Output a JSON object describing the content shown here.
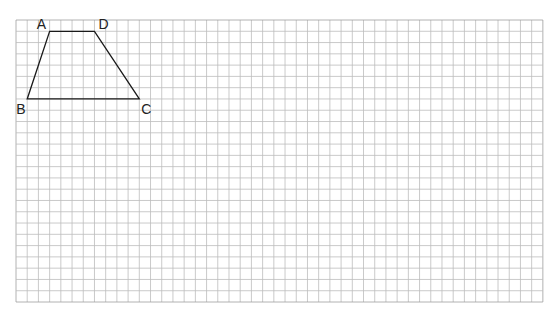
{
  "grid": {
    "left": 16,
    "top": 20,
    "cols": 47,
    "rows": 25,
    "cell_w": 11.21,
    "cell_h": 11.28,
    "line_color": "#bdbdbd",
    "border_color": "#9e9e9e"
  },
  "shape": {
    "name": "trapezoid ABCD",
    "stroke_color": "#1a1a1a",
    "vertices": [
      {
        "label": "A",
        "col": 3,
        "row": 1,
        "label_dx": -13,
        "label_dy": -2
      },
      {
        "label": "D",
        "col": 7,
        "row": 1,
        "label_dx": 4,
        "label_dy": -2
      },
      {
        "label": "C",
        "col": 11,
        "row": 7,
        "label_dx": 2,
        "label_dy": 15
      },
      {
        "label": "B",
        "col": 1,
        "row": 7,
        "label_dx": -11,
        "label_dy": 15
      }
    ]
  },
  "labels": {
    "A": "A",
    "B": "B",
    "C": "C",
    "D": "D"
  }
}
